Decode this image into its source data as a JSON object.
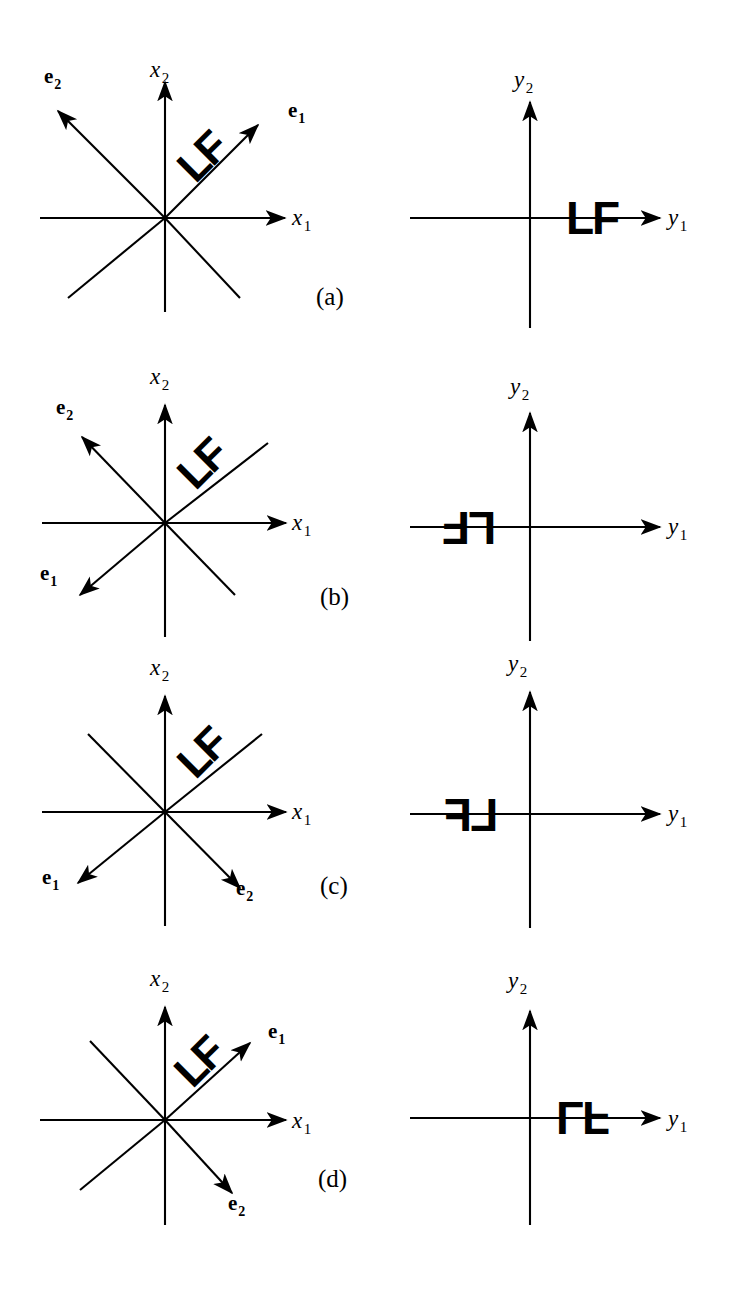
{
  "figure": {
    "motif": "LF",
    "stroke_color": "#000000",
    "background_color": "#ffffff"
  },
  "panels": [
    {
      "id": "a",
      "label": "(a)",
      "left_diagram": {
        "name": "x-coordinate-system",
        "axis_x_label": "x",
        "axis_x_sub": "1",
        "axis_y_label": "x",
        "axis_y_sub": "2",
        "motif": "LF",
        "motif_rotation_deg": -45,
        "basis_vectors": [
          {
            "name": "e",
            "sub": "1",
            "direction_deg": 45,
            "label_x": 288,
            "label_y": 100
          },
          {
            "name": "e",
            "sub": "2",
            "direction_deg": 135,
            "label_x": 44,
            "label_y": 66
          }
        ]
      },
      "right_diagram": {
        "name": "y-coordinate-system",
        "axis_x_label": "y",
        "axis_x_sub": "1",
        "axis_y_label": "y",
        "axis_y_sub": "2",
        "motif": "LF",
        "motif_transform": "identity",
        "motif_side": "right"
      }
    },
    {
      "id": "b",
      "label": "(b)",
      "left_diagram": {
        "name": "x-coordinate-system",
        "axis_x_label": "x",
        "axis_x_sub": "1",
        "axis_y_label": "x",
        "axis_y_sub": "2",
        "motif": "LF",
        "motif_rotation_deg": -45,
        "basis_vectors": [
          {
            "name": "e",
            "sub": "1",
            "direction_deg": 225,
            "label_x": 40,
            "label_y": 208
          },
          {
            "name": "e",
            "sub": "2",
            "direction_deg": 135,
            "label_x": 56,
            "label_y": 42
          }
        ]
      },
      "right_diagram": {
        "name": "y-coordinate-system",
        "axis_x_label": "y",
        "axis_x_sub": "1",
        "axis_y_label": "y",
        "axis_y_sub": "2",
        "motif": "LF",
        "motif_transform": "rotate-180",
        "motif_side": "left"
      }
    },
    {
      "id": "c",
      "label": "(c)",
      "left_diagram": {
        "name": "x-coordinate-system",
        "axis_x_label": "x",
        "axis_x_sub": "1",
        "axis_y_label": "x",
        "axis_y_sub": "2",
        "motif": "LF",
        "motif_rotation_deg": -45,
        "basis_vectors": [
          {
            "name": "e",
            "sub": "1",
            "direction_deg": 225,
            "label_x": 42,
            "label_y": 227
          },
          {
            "name": "e",
            "sub": "2",
            "direction_deg": 315,
            "label_x": 236,
            "label_y": 238
          }
        ]
      },
      "right_diagram": {
        "name": "y-coordinate-system",
        "axis_x_label": "y",
        "axis_x_sub": "1",
        "axis_y_label": "y",
        "axis_y_sub": "2",
        "motif": "LF",
        "motif_transform": "mirror-horizontal",
        "motif_side": "left"
      }
    },
    {
      "id": "d",
      "label": "(d)",
      "left_diagram": {
        "name": "x-coordinate-system",
        "axis_x_label": "x",
        "axis_x_sub": "1",
        "axis_y_label": "x",
        "axis_y_sub": "2",
        "motif": "LF",
        "motif_rotation_deg": -45,
        "basis_vectors": [
          {
            "name": "e",
            "sub": "1",
            "direction_deg": 45,
            "label_x": 268,
            "label_y": 96
          },
          {
            "name": "e",
            "sub": "2",
            "direction_deg": 315,
            "label_x": 228,
            "label_y": 240
          }
        ]
      },
      "right_diagram": {
        "name": "y-coordinate-system",
        "axis_x_label": "y",
        "axis_x_sub": "1",
        "axis_y_label": "y",
        "axis_y_sub": "2",
        "motif": "LF",
        "motif_transform": "mirror-vertical",
        "motif_side": "right"
      }
    }
  ]
}
